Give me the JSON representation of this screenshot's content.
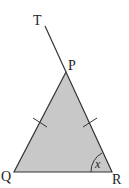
{
  "diagram": {
    "type": "geometry-triangle",
    "fill_color": "#c8c8c8",
    "stroke_color": "#333333",
    "points": {
      "T": {
        "label": "T"
      },
      "P": {
        "label": "P"
      },
      "Q": {
        "label": "Q"
      },
      "R": {
        "label": "R"
      }
    },
    "angle_label": "x",
    "equal_sides": [
      "PQ",
      "PR"
    ]
  }
}
